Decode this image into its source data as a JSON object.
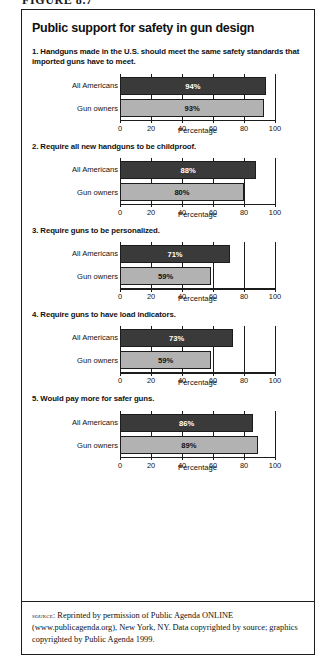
{
  "figure_number": "FIGURE 8.7",
  "title": "Public support for safety in gun design",
  "axis": {
    "title": "Percentage",
    "ticks": [
      "0",
      "20",
      "40",
      "60",
      "80",
      "100"
    ]
  },
  "categories": [
    "All Americans",
    "Gun owners"
  ],
  "source": {
    "label": "source:",
    "text": " Reprinted by permission of Public Agenda ONLINE (www.publicagenda.org), New York, NY. Data copyrighted by source; graphics copyrighted by Public Agenda 1999."
  },
  "questions": [
    {
      "text": "1. Handguns made in the U.S. should meet the same safety standards that imported guns have to meet.",
      "values": [
        94,
        93
      ],
      "value_labels": [
        "94%",
        "93%"
      ]
    },
    {
      "text": "2. Require all new handguns to be childproof.",
      "values": [
        88,
        80
      ],
      "value_labels": [
        "88%",
        "80%"
      ]
    },
    {
      "text": "3. Require guns to be personalized.",
      "values": [
        71,
        59
      ],
      "value_labels": [
        "71%",
        "59%"
      ]
    },
    {
      "text": "4. Require guns to have load indicators.",
      "values": [
        73,
        59
      ],
      "value_labels": [
        "73%",
        "59%"
      ]
    },
    {
      "text": "5. Would pay more for safer guns.",
      "values": [
        86,
        89
      ],
      "value_labels": [
        "86%",
        "89%"
      ]
    }
  ],
  "chart_data": {
    "type": "bar",
    "orientation": "horizontal",
    "title": "Public support for safety in gun design",
    "xlabel": "Percentage",
    "ylabel": "",
    "xlim": [
      0,
      100
    ],
    "xticks": [
      0,
      20,
      40,
      60,
      80,
      100
    ],
    "grid": true,
    "legend": "none",
    "categories": [
      "All Americans",
      "Gun owners"
    ],
    "colors": {
      "all_americans": "#3a3a3a",
      "gun_owners": "#b2b2b2",
      "axis": "#1c1c1c",
      "background": "#ffffff"
    },
    "panels": [
      {
        "panel": 1,
        "question": "1. Handguns made in the U.S. should meet the same safety standards that imported guns have to meet.",
        "series": [
          {
            "name": "All Americans",
            "value": 94
          },
          {
            "name": "Gun owners",
            "value": 93
          }
        ]
      },
      {
        "panel": 2,
        "question": "2. Require all new handguns to be childproof.",
        "series": [
          {
            "name": "All Americans",
            "value": 88
          },
          {
            "name": "Gun owners",
            "value": 80
          }
        ]
      },
      {
        "panel": 3,
        "question": "3. Require guns to be personalized.",
        "series": [
          {
            "name": "All Americans",
            "value": 71
          },
          {
            "name": "Gun owners",
            "value": 59
          }
        ]
      },
      {
        "panel": 4,
        "question": "4. Require guns to have load indicators.",
        "series": [
          {
            "name": "All Americans",
            "value": 73
          },
          {
            "name": "Gun owners",
            "value": 59
          }
        ]
      },
      {
        "panel": 5,
        "question": "5. Would pay more for safer guns.",
        "series": [
          {
            "name": "All Americans",
            "value": 86
          },
          {
            "name": "Gun owners",
            "value": 89
          }
        ]
      }
    ]
  }
}
